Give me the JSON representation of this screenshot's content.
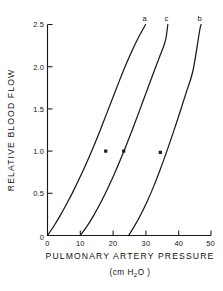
{
  "chart_data": {
    "type": "line",
    "title": "",
    "xlabel": "PULMONARY ARTERY PRESSURE",
    "xunit": "(cm H2O)",
    "xunit_prefix": "(cm H",
    "xunit_sub": "2",
    "xunit_suffix": "O )",
    "ylabel": "RELATIVE BLOOD FLOW",
    "xlim": [
      0,
      50
    ],
    "ylim": [
      0,
      2.5
    ],
    "xticks": [
      0,
      10,
      20,
      30,
      40,
      50
    ],
    "xtick_labels": [
      "0",
      "10",
      "20",
      "30",
      "40",
      "50"
    ],
    "yticks": [
      0,
      0.5,
      1.0,
      1.5,
      2.0,
      2.5
    ],
    "ytick_labels": [
      "0",
      "0.5",
      "1.0",
      "1.5",
      "2.0",
      "2.5"
    ],
    "grid": false,
    "legend": "inline-curve-labels",
    "series": [
      {
        "name": "a",
        "label": "a",
        "label_x": 29.8,
        "label_y": 2.72,
        "x": [
          0.0,
          2.0,
          4.0,
          6.0,
          8.0,
          10.0,
          12.0,
          14.0,
          16.0,
          18.0,
          20.0,
          22.0,
          24.0,
          26.0,
          28.0,
          30.0
        ],
        "y": [
          0.0,
          0.115,
          0.245,
          0.385,
          0.535,
          0.695,
          0.865,
          1.045,
          1.235,
          1.435,
          1.635,
          1.835,
          2.025,
          2.2,
          2.36,
          2.5
        ],
        "marker_points": [
          {
            "x": 17.8,
            "y": 1.0
          }
        ]
      },
      {
        "name": "c",
        "label": "c",
        "label_x": 36.5,
        "label_y": 2.72,
        "x": [
          10.0,
          12.0,
          14.0,
          16.0,
          18.0,
          20.0,
          22.0,
          24.0,
          26.0,
          28.0,
          30.0,
          32.0,
          34.0,
          36.0,
          36.8
        ],
        "y": [
          0.0,
          0.105,
          0.23,
          0.37,
          0.525,
          0.69,
          0.87,
          1.06,
          1.26,
          1.465,
          1.675,
          1.885,
          2.09,
          2.3,
          2.5
        ],
        "marker_points": [
          {
            "x": 23.3,
            "y": 1.0
          }
        ]
      },
      {
        "name": "b",
        "label": "b",
        "label_x": 46.6,
        "label_y": 2.72,
        "x": [
          24.8,
          26.5,
          28.5,
          30.5,
          32.5,
          34.5,
          36.5,
          38.5,
          40.5,
          42.5,
          44.5,
          46.5,
          47.0
        ],
        "y": [
          0.0,
          0.105,
          0.245,
          0.405,
          0.585,
          0.785,
          1.0,
          1.225,
          1.46,
          1.705,
          1.955,
          2.42,
          2.5
        ],
        "marker_points": [
          {
            "x": 34.5,
            "y": 0.985
          }
        ]
      }
    ]
  }
}
